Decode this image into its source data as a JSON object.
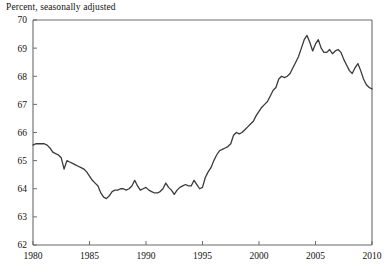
{
  "chart_data": {
    "type": "line",
    "title": "Percent, seasonally adjusted",
    "xlabel": "",
    "ylabel": "",
    "xlim": [
      1980,
      2010
    ],
    "ylim": [
      62,
      70
    ],
    "xticks": [
      1980,
      1985,
      1990,
      1995,
      2000,
      2005,
      2010
    ],
    "xtick_labels": [
      "1980",
      "1985",
      "1990",
      "1995",
      "2000",
      "2005",
      "2010"
    ],
    "yticks": [
      62,
      63,
      64,
      65,
      66,
      67,
      68,
      69,
      70
    ],
    "ytick_labels": [
      "62",
      "63",
      "64",
      "65",
      "66",
      "67",
      "68",
      "69",
      "70"
    ],
    "grid": false,
    "legend": null,
    "line_color": "#3a3a3a",
    "line_width": 1.3,
    "axis_color": "#6b6b6b",
    "series": [
      {
        "name": "Labor force participation rate",
        "x": [
          1980.0,
          1980.25,
          1980.5,
          1980.75,
          1981.0,
          1981.25,
          1981.5,
          1981.75,
          1982.0,
          1982.25,
          1982.5,
          1982.75,
          1983.0,
          1983.25,
          1983.5,
          1983.75,
          1984.0,
          1984.25,
          1984.5,
          1984.75,
          1985.0,
          1985.25,
          1985.5,
          1985.75,
          1986.0,
          1986.25,
          1986.5,
          1986.75,
          1987.0,
          1987.25,
          1987.5,
          1987.75,
          1988.0,
          1988.25,
          1988.5,
          1988.75,
          1989.0,
          1989.25,
          1989.5,
          1989.75,
          1990.0,
          1990.25,
          1990.5,
          1990.75,
          1991.0,
          1991.25,
          1991.5,
          1991.75,
          1992.0,
          1992.25,
          1992.5,
          1992.75,
          1993.0,
          1993.25,
          1993.5,
          1993.75,
          1994.0,
          1994.25,
          1994.5,
          1994.75,
          1995.0,
          1995.25,
          1995.5,
          1995.75,
          1996.0,
          1996.25,
          1996.5,
          1996.75,
          1997.0,
          1997.25,
          1997.5,
          1997.75,
          1998.0,
          1998.25,
          1998.5,
          1998.75,
          1999.0,
          1999.25,
          1999.5,
          1999.75,
          2000.0,
          2000.25,
          2000.5,
          2000.75,
          2001.0,
          2001.25,
          2001.5,
          2001.75,
          2002.0,
          2002.25,
          2002.5,
          2002.75,
          2003.0,
          2003.25,
          2003.5,
          2003.75,
          2004.0,
          2004.25,
          2004.5,
          2004.75,
          2005.0,
          2005.25,
          2005.5,
          2005.75,
          2006.0,
          2006.25,
          2006.5,
          2006.75,
          2007.0,
          2007.25,
          2007.5,
          2007.75,
          2008.0,
          2008.25,
          2008.5,
          2008.75,
          2009.0,
          2009.25,
          2009.5,
          2009.75,
          2010.0
        ],
        "y": [
          65.55,
          65.6,
          65.6,
          65.6,
          65.6,
          65.55,
          65.45,
          65.3,
          65.25,
          65.2,
          65.1,
          64.7,
          65.0,
          64.95,
          64.9,
          64.85,
          64.8,
          64.75,
          64.7,
          64.6,
          64.45,
          64.3,
          64.2,
          64.1,
          63.85,
          63.7,
          63.65,
          63.75,
          63.9,
          63.95,
          63.95,
          64.0,
          64.0,
          63.95,
          64.0,
          64.1,
          64.3,
          64.1,
          63.95,
          64.0,
          64.05,
          63.95,
          63.9,
          63.85,
          63.85,
          63.9,
          64.0,
          64.2,
          64.05,
          63.95,
          63.8,
          63.95,
          64.05,
          64.1,
          64.15,
          64.1,
          64.1,
          64.3,
          64.15,
          64.0,
          64.05,
          64.4,
          64.6,
          64.75,
          65.0,
          65.2,
          65.35,
          65.4,
          65.45,
          65.5,
          65.6,
          65.9,
          66.0,
          65.95,
          66.0,
          66.1,
          66.2,
          66.3,
          66.4,
          66.6,
          66.75,
          66.9,
          67.0,
          67.1,
          67.3,
          67.5,
          67.6,
          67.9,
          68.0,
          67.95,
          68.0,
          68.1,
          68.3,
          68.5,
          68.7,
          69.0,
          69.3,
          69.45,
          69.2,
          68.9,
          69.15,
          69.3,
          69.0,
          68.85,
          68.85,
          68.95,
          68.8,
          68.9,
          68.95,
          68.85,
          68.6,
          68.4,
          68.2,
          68.1,
          68.3,
          68.45,
          68.2,
          67.9,
          67.7,
          67.6,
          67.55
        ]
      }
    ]
  }
}
